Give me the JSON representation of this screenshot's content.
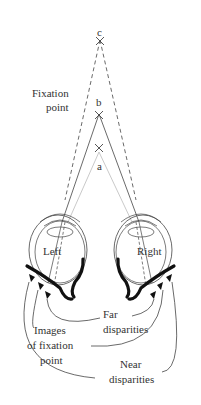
{
  "points": {
    "a": {
      "label": "a",
      "x": 99,
      "y": 148
    },
    "b": {
      "label": "b",
      "x": 99,
      "y": 114
    },
    "c": {
      "label": "c",
      "x": 100,
      "y": 40
    }
  },
  "labels": {
    "fixation_line1": "Fixation",
    "fixation_line2": "point",
    "left_eye": "Left",
    "right_eye": "Right",
    "far_line1": "Far",
    "far_line2": "disparities",
    "images_line1": "Images",
    "images_line2": "of fixation",
    "images_line3": "point",
    "near_line1": "Near",
    "near_line2": "disparities"
  },
  "colors": {
    "line": "#444444",
    "light_line": "#bbbbbb",
    "text": "#333333",
    "retina": "#111111"
  }
}
